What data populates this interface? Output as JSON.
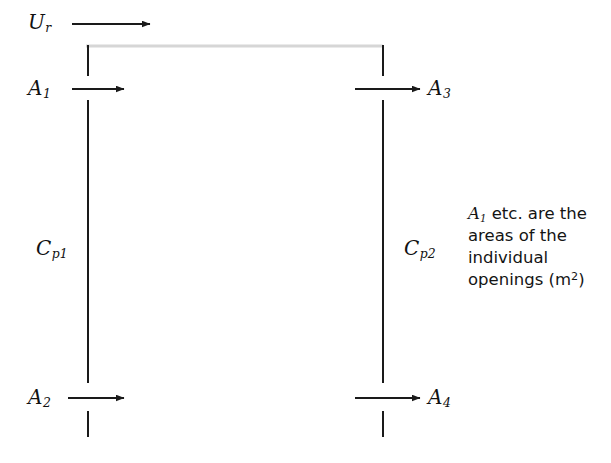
{
  "figure": {
    "type": "airflow-schematic",
    "background_color": "#ffffff",
    "line_color": "#1a1a1a",
    "roof_line_color": "#d8d8d8"
  },
  "labels": {
    "wind_speed": {
      "symbol": "U",
      "subscript": "r"
    },
    "opening_1": {
      "symbol": "A",
      "subscript": "1"
    },
    "opening_2": {
      "symbol": "A",
      "subscript": "2"
    },
    "opening_3": {
      "symbol": "A",
      "subscript": "3"
    },
    "opening_4": {
      "symbol": "A",
      "subscript": "4"
    },
    "pressure_coeff_windward": {
      "symbol": "C",
      "subscript": "p1"
    },
    "pressure_coeff_leeward": {
      "symbol": "C",
      "subscript": "p2"
    }
  },
  "caption": {
    "line1_symbol": "A",
    "line1_subscript": "1",
    "line1_rest": " etc. are the",
    "line2": "areas of the",
    "line3": "individual",
    "line4_pre": "openings (m",
    "line4_sup": "2",
    "line4_post": ")"
  },
  "geometry": {
    "left_wall_x": 88,
    "right_wall_x": 383,
    "roof_y": 46,
    "upper_arrow_y": 89,
    "lower_arrow_y": 398,
    "wind_arrow_y": 24
  }
}
